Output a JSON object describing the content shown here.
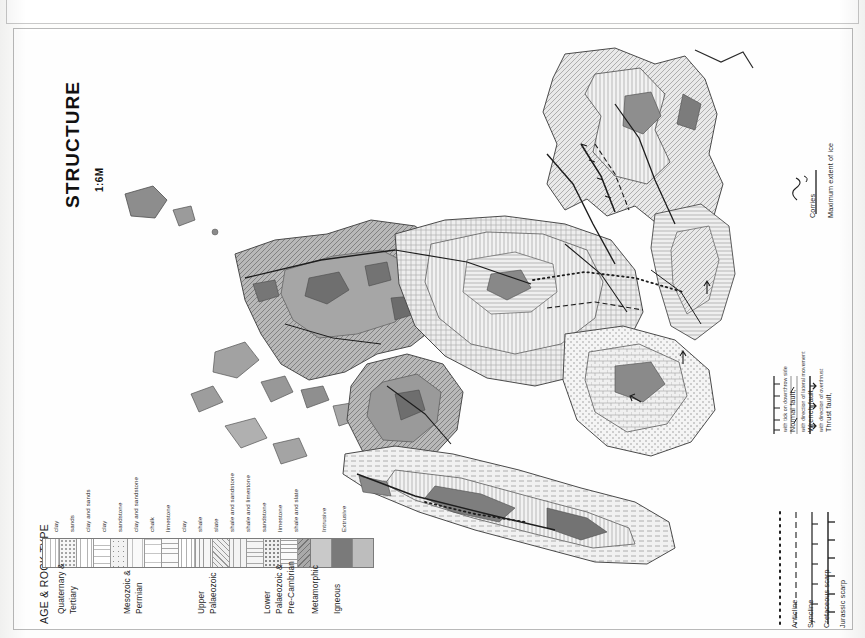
{
  "sheet": {
    "title": "STRUCTURE",
    "scale": "1:6M"
  },
  "rock_legend": {
    "title": "AGE & ROCK TYPE",
    "groups": [
      {
        "name": "Quaternary &\nTertiary",
        "line1": "Quaternary &",
        "line2": "Tertiary",
        "types": [
          "clay",
          "sands",
          "clay and sands",
          "clay",
          "sandstone",
          "clay and sandstone"
        ]
      },
      {
        "name": "Mesozoic &\nPermian",
        "line1": "Mesozoic &",
        "line2": "Permian",
        "types": [
          "chalk",
          "limestone",
          "clay",
          "shale"
        ]
      },
      {
        "name": "Upper\nPalaeozoic",
        "line1": "Upper",
        "line2": "Palaeozoic",
        "types": [
          "slate",
          "shale and sandstone",
          "shale and limestone"
        ]
      },
      {
        "name": "Lower\nPalaeozoic &\nPre-Cambrian",
        "line1": "Lower",
        "line2": "Palaeozoic &",
        "line3": "Pre-Cambrian",
        "types": [
          "sandstone",
          "limestone",
          "shale and slate"
        ]
      },
      {
        "name": "Metamorphic",
        "line1": "Metamorphic",
        "line2": "",
        "types": []
      },
      {
        "name": "Igneous",
        "line1": "Igneous",
        "line2": "",
        "types": [
          "Intrusive",
          "Extrusive"
        ]
      }
    ],
    "rock_types_in_order": [
      "clay",
      "sands",
      "clay and sands",
      "clay",
      "sandstone",
      "clay and sandstone",
      "chalk",
      "limestone",
      "clay",
      "shale",
      "slate",
      "shale and sandstone",
      "shale and limestone",
      "sandstone",
      "limestone",
      "shale and slate"
    ],
    "igneous_types": [
      "Intrusive",
      "Extrusive"
    ]
  },
  "symbol_legend": {
    "items": [
      {
        "label": "Anticline",
        "icon": "dotted-line-icon",
        "detail": ""
      },
      {
        "label": "Syncline",
        "icon": "dashed-line-icon",
        "detail": ""
      },
      {
        "label": "Cretaceous scarp",
        "icon": "ticked-line-icon",
        "detail": ""
      },
      {
        "label": "Jurassic scarp",
        "icon": "ticked-line-icon",
        "detail": ""
      },
      {
        "label": "Normal fault,",
        "icon": "normal-fault-icon",
        "detail": "with tick on downthrow side"
      },
      {
        "label": "Wrench fault,",
        "icon": "wrench-fault-icon",
        "detail": "with direction of lateral movement"
      },
      {
        "label": "Thrust fault,",
        "icon": "thrust-fault-icon",
        "detail": "with direction of overthrust"
      },
      {
        "label": "Corries",
        "icon": "corrie-icon",
        "detail": ""
      },
      {
        "label": "Maximum extent of ice",
        "icon": "solid-line-icon",
        "detail": ""
      }
    ]
  },
  "colors": {
    "ink": "#1a1a1a",
    "paper": "#fdfdfc",
    "light_unit": "#efefef",
    "mid_unit": "#b5b5b5",
    "dark_unit": "#8a8a8a",
    "darkest_unit": "#6e6e6e",
    "frame": "#b9b9b9"
  }
}
